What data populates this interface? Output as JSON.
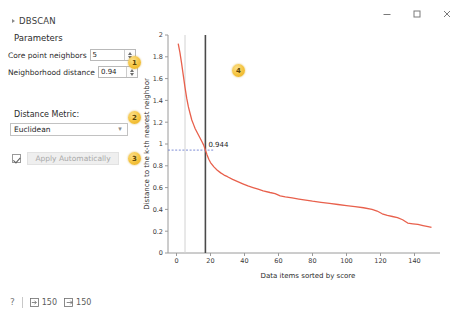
{
  "window": {
    "controls": [
      {
        "name": "minimize-button",
        "glyph": "─"
      },
      {
        "name": "maximize-button",
        "glyph": "□"
      },
      {
        "name": "close-button",
        "glyph": "✕"
      }
    ]
  },
  "panel": {
    "section_title": "DBSCAN",
    "group_title": "Parameters",
    "core_point_label": "Core point neighbors",
    "core_point_value": "5",
    "neighborhood_label": "Neighborhood distance",
    "neighborhood_value": "0.94",
    "metric_label": "Distance Metric:",
    "metric_value": "Euclidean",
    "apply_label": "Apply Automatically",
    "badges": [
      {
        "id": "1",
        "label": "1"
      },
      {
        "id": "2",
        "label": "2"
      },
      {
        "id": "3",
        "label": "3"
      }
    ]
  },
  "chart_badge": {
    "label": "4"
  },
  "statusbar": {
    "help_glyph": "?",
    "input_count": "150",
    "output_count": "150"
  },
  "chart_data": {
    "type": "line",
    "title": "",
    "xlabel": "Data items sorted by score",
    "ylabel": "Distance to the k-th nearest neighbor",
    "xlim": [
      -5,
      155
    ],
    "ylim": [
      0,
      2
    ],
    "xticks": [
      0,
      20,
      40,
      60,
      80,
      100,
      120,
      140
    ],
    "yticks": [
      0,
      0.2,
      0.4,
      0.6,
      0.8,
      1,
      1.2,
      1.4,
      1.6,
      1.8,
      2
    ],
    "grid": false,
    "series": [
      {
        "name": "k-distance",
        "color": "#e8604c",
        "x": [
          1,
          2,
          3,
          4,
          5,
          6,
          7,
          8,
          9,
          10,
          11,
          12,
          13,
          14,
          15,
          16,
          17,
          18,
          19,
          20,
          22,
          24,
          26,
          28,
          30,
          33,
          36,
          39,
          42,
          45,
          48,
          51,
          55,
          58,
          61,
          64,
          68,
          72,
          76,
          80,
          85,
          90,
          95,
          100,
          105,
          110,
          115,
          118,
          121,
          124,
          127,
          130,
          133,
          136,
          139,
          142,
          145,
          148,
          150
        ],
        "y": [
          1.92,
          1.84,
          1.74,
          1.63,
          1.52,
          1.42,
          1.34,
          1.28,
          1.22,
          1.18,
          1.14,
          1.11,
          1.08,
          1.05,
          1.02,
          0.99,
          0.944,
          0.9,
          0.86,
          0.83,
          0.79,
          0.76,
          0.735,
          0.715,
          0.7,
          0.675,
          0.655,
          0.635,
          0.615,
          0.6,
          0.585,
          0.57,
          0.555,
          0.545,
          0.525,
          0.515,
          0.505,
          0.495,
          0.485,
          0.475,
          0.465,
          0.455,
          0.445,
          0.435,
          0.425,
          0.415,
          0.4,
          0.385,
          0.36,
          0.345,
          0.335,
          0.325,
          0.305,
          0.275,
          0.268,
          0.262,
          0.252,
          0.242,
          0.235
        ]
      }
    ],
    "annotations": [
      {
        "type": "vline",
        "x": 17,
        "color": "#4a4a4a",
        "label": ""
      },
      {
        "type": "vline",
        "x": 5,
        "color": "#cfcfcf",
        "label": ""
      },
      {
        "type": "hline",
        "y": 0.944,
        "color": "#6f7fd0",
        "style": "dotted",
        "label": "0.944"
      }
    ],
    "threshold_label": "0.944"
  }
}
